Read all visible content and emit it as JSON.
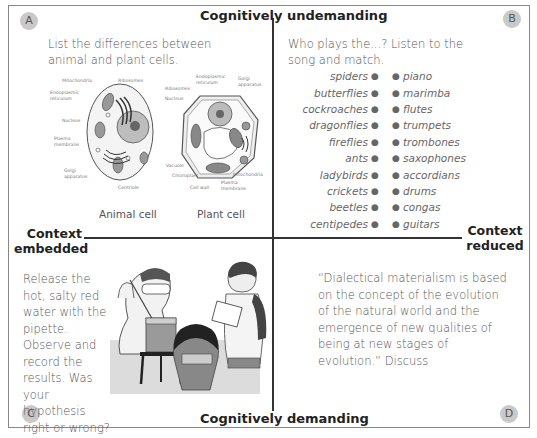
{
  "axes": {
    "top": "Cognitively undemanding",
    "bottom": "Cognitively demanding",
    "left": [
      "Context",
      "embedded"
    ],
    "right": [
      "Context",
      "reduced"
    ]
  },
  "quadrants": {
    "A": {
      "badge": "A",
      "instruction": "List the differences between animal and plant cells.",
      "diagrams": {
        "animal": {
          "caption": "Animal cell",
          "labels": [
            "Mitochondria",
            "Ribosomes",
            "Endoplasmic reticulum",
            "Nucleus",
            "Plasma membrane",
            "Golgi apparatus",
            "Centriole"
          ]
        },
        "plant": {
          "caption": "Plant cell",
          "labels": [
            "Ribosomes",
            "Endoplasmic reticulum",
            "Golgi apparatus",
            "Nucleus",
            "Vacuole",
            "Chloroplast",
            "Cell wall",
            "Plasma membrane",
            "Mitochondria"
          ]
        }
      }
    },
    "B": {
      "badge": "B",
      "instruction": "Who plays the...? Listen to the song and match.",
      "left_items": [
        "spiders",
        "butterflies",
        "cockroaches",
        "dragonflies",
        "fireflies",
        "ants",
        "ladybirds",
        "crickets",
        "beetles",
        "centipedes"
      ],
      "right_items": [
        "piano",
        "marimba",
        "flutes",
        "trumpets",
        "trombones",
        "saxophones",
        "accordians",
        "drums",
        "congas",
        "guitars"
      ]
    },
    "C": {
      "badge": "C",
      "instruction": "Release the hot, salty red water with the pipette. Observe and record the results. Was your hypothesis right or wrong?",
      "illustration": "students-lab-experiment"
    },
    "D": {
      "badge": "D",
      "instruction": "“Dialectical materialism is based on the concept of the evolution of the natural world and the emergence of new qualities of being at new stages of evolution.” Discuss"
    }
  },
  "colors": {
    "axis": "#333333",
    "text": "#555555",
    "badge_bg": "#c9c9c9",
    "frame": "#888888"
  }
}
